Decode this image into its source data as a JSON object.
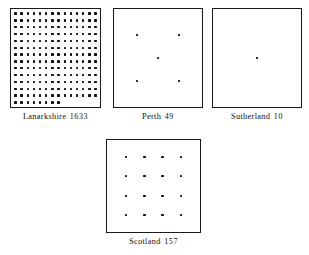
{
  "figure": {
    "kind": "unit-dot-array-plate",
    "width": 309,
    "height": 255,
    "background_color": "#ffffff",
    "ink_color": "#111111",
    "border_color": "#1a1a1a"
  },
  "chart_data": {
    "type": "scatter",
    "title": "",
    "subtitle": "",
    "xlabel": "",
    "ylabel": "",
    "grid": false,
    "legend": null,
    "note": "Four bordered plates; each plate shows a square array of dots whose count encodes the labelled quantity (one dot per unit of scale).",
    "categories": [
      "Lanarkshire",
      "Perth",
      "Sutherland",
      "Scotland"
    ],
    "values": [
      1633,
      49,
      10,
      157
    ],
    "dot_counts": [
      190,
      5,
      1,
      16
    ],
    "panels": [
      {
        "name": "Lanarkshire",
        "count": "1633",
        "label": "Lanarkshire 1633",
        "dot_layout": "grid",
        "cols": 14,
        "rows": 14,
        "last_row_cols": 8,
        "dots_total": 190
      },
      {
        "name": "Perth",
        "count": "49",
        "label": "Perth 49",
        "dot_layout": "quincunx",
        "cols": 2,
        "rows": 2,
        "center_dot": true,
        "dots_total": 5
      },
      {
        "name": "Sutherland",
        "count": "10",
        "label": "Sutherland 10",
        "dot_layout": "single-center",
        "cols": 1,
        "rows": 1,
        "dots_total": 1
      },
      {
        "name": "Scotland",
        "count": "157",
        "label": "Scotland 157",
        "dot_layout": "grid",
        "cols": 4,
        "rows": 4,
        "dots_total": 16
      }
    ]
  },
  "panels": {
    "lanarkshire": {
      "name": "Lanarkshire",
      "count": "1633"
    },
    "perth": {
      "name": "Perth",
      "count": "49"
    },
    "sutherland": {
      "name": "Sutherland",
      "count": "10"
    },
    "scotland": {
      "name": "Scotland",
      "count": "157"
    }
  }
}
